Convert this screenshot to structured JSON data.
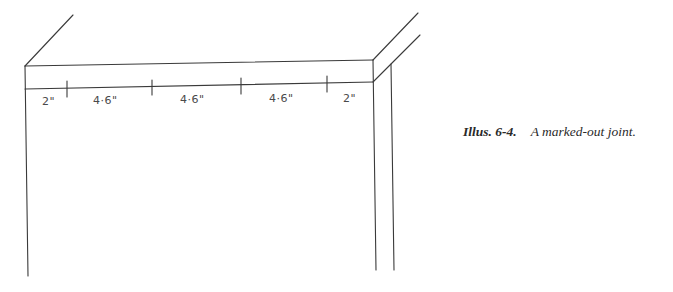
{
  "figure": {
    "caption_label": "Illus. 6-4.",
    "caption_text": "A marked-out joint."
  },
  "dimensions": [
    {
      "label": "2\"",
      "x": 42,
      "y": 105
    },
    {
      "label": "4·6\"",
      "x": 93,
      "y": 104
    },
    {
      "label": "4·6\"",
      "x": 180,
      "y": 103
    },
    {
      "label": "4·6\"",
      "x": 269,
      "y": 102
    },
    {
      "label": "2\"",
      "x": 343,
      "y": 102
    }
  ],
  "colors": {
    "line": "#3a3a3a",
    "background": "#ffffff"
  }
}
